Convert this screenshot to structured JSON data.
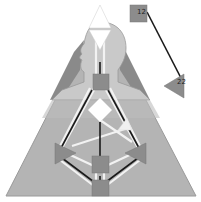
{
  "diagram": {
    "type": "bodygraph",
    "colors": {
      "background": "#ffffff",
      "outer_triangle": "#b4b4b4",
      "aura_dark": "#8a8a8a",
      "head_silhouette": "#c9c9c9",
      "channel_white": "#f2f2f2",
      "channel_defined": "#1a1a1a",
      "center_undefined": "#ffffff",
      "center_gray": "#8c8c8c"
    },
    "centers": [
      {
        "name": "head",
        "shape": "triangle",
        "state": "white"
      },
      {
        "name": "ajna",
        "shape": "triangle-down",
        "state": "white"
      },
      {
        "name": "throat",
        "shape": "square",
        "state": "gray"
      },
      {
        "name": "g",
        "shape": "diamond",
        "state": "white"
      },
      {
        "name": "ego",
        "shape": "triangle",
        "state": "white"
      },
      {
        "name": "spleen",
        "shape": "triangle",
        "state": "gray"
      },
      {
        "name": "solar-plexus",
        "shape": "triangle",
        "state": "gray"
      },
      {
        "name": "sacral",
        "shape": "square",
        "state": "gray"
      },
      {
        "name": "root",
        "shape": "square",
        "state": "gray"
      }
    ],
    "detached": {
      "square_label": "12",
      "triangle_label": "22"
    }
  }
}
